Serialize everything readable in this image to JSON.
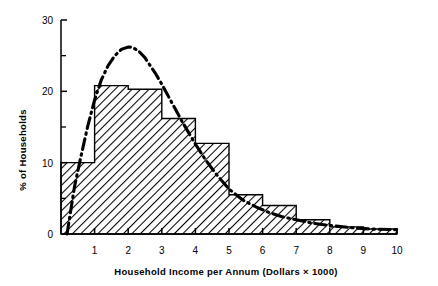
{
  "chart_data": {
    "type": "bar",
    "title": "",
    "subtitle": "",
    "xlabel": "Household Income per Annum (Dollars × 1000)",
    "ylabel": "% of Households",
    "xlim": [
      0,
      10
    ],
    "ylim": [
      0,
      30
    ],
    "grid": false,
    "legend": "none",
    "x_tick_labels": [
      "1",
      "2",
      "3",
      "4",
      "5",
      "6",
      "7",
      "8",
      "9",
      "10"
    ],
    "x_tick_values": [
      1,
      2,
      3,
      4,
      5,
      6,
      7,
      8,
      9,
      10
    ],
    "y_tick_labels": [
      "0",
      "10",
      "20",
      "30"
    ],
    "y_tick_values": [
      0,
      10,
      20,
      30
    ],
    "y_minor_tick_values": [
      5,
      15,
      25
    ],
    "bin_width": 1,
    "bin_edges": [
      0,
      1,
      2,
      3,
      4,
      5,
      6,
      7,
      8,
      9,
      10
    ],
    "categories": [
      "0-1",
      "1-2",
      "2-3",
      "3-4",
      "4-5",
      "5-6",
      "6-7",
      "7-8",
      "8-9",
      "9-10"
    ],
    "values": [
      10.0,
      20.8,
      20.3,
      16.2,
      12.7,
      5.5,
      4.0,
      2.0,
      1.0,
      0.7
    ],
    "bar_style": {
      "fill": "diagonal-hatch",
      "hatch_color": "#000000",
      "edge_color": "#000000",
      "face_color": "#ffffff"
    },
    "series": [
      {
        "name": "histogram",
        "type": "bar",
        "values": [
          10.0,
          20.8,
          20.3,
          16.2,
          12.7,
          5.5,
          4.0,
          2.0,
          1.0,
          0.7
        ]
      },
      {
        "name": "fitted-curve",
        "type": "line",
        "line_style": "dash-dot",
        "line_color": "#000000",
        "x": [
          0.18,
          0.4,
          0.6,
          0.8,
          1.0,
          1.2,
          1.4,
          1.6,
          1.8,
          2.0,
          2.1,
          2.3,
          2.5,
          2.8,
          3.0,
          3.3,
          3.6,
          4.0,
          4.3,
          4.6,
          5.0,
          5.4,
          5.8,
          6.2,
          6.6,
          7.0,
          7.5,
          8.0,
          8.6,
          9.2,
          10.0
        ],
        "y": [
          0.0,
          6.6,
          11.0,
          15.2,
          18.8,
          21.6,
          23.6,
          25.0,
          25.9,
          26.2,
          26.2,
          25.7,
          24.7,
          22.6,
          21.0,
          18.4,
          15.8,
          12.6,
          10.4,
          8.5,
          6.3,
          4.8,
          3.8,
          3.0,
          2.4,
          2.0,
          1.5,
          1.2,
          0.9,
          0.7,
          0.6
        ]
      }
    ],
    "curve_peak": {
      "x": 2.1,
      "y": 26.2
    }
  }
}
